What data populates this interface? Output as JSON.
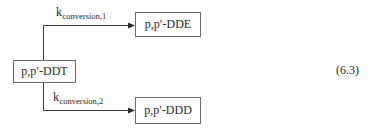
{
  "diagram": {
    "type": "reaction-scheme",
    "nodes": {
      "source": {
        "id": "ddt",
        "label": "p,p′-DDT"
      },
      "top_product": {
        "id": "dde",
        "label": "p,p′-DDE"
      },
      "bottom_product": {
        "id": "ddd",
        "label": "p,p′-DDD"
      }
    },
    "edges": [
      {
        "from": "ddt",
        "to": "dde",
        "rate_symbol": "k",
        "rate_subscript": "conversion,1"
      },
      {
        "from": "ddt",
        "to": "ddd",
        "rate_symbol": "k",
        "rate_subscript": "conversion,2"
      }
    ],
    "equation_number": "(6.3)"
  },
  "colors": {
    "line": "#3a3a3a",
    "box_border": "#6a6a6a",
    "text": "#2a2a2a",
    "background": "#ffffff"
  }
}
